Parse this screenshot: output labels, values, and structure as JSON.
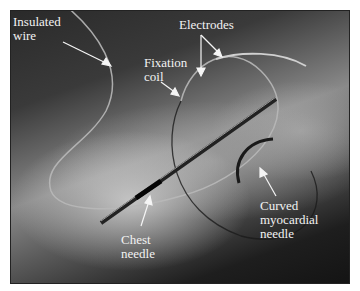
{
  "figure": {
    "labels": {
      "insulated_wire": "Insulated\nwire",
      "electrodes": "Electrodes",
      "fixation_coil": "Fixation\ncoil",
      "chest_needle": "Chest\nneedle",
      "curved_needle": "Curved\nmyocardial\nneedle"
    },
    "colors": {
      "label_text": "#f2f2f2",
      "arrow": "#f5f5f5",
      "frame_border": "#222222",
      "page_background": "#ffffff"
    }
  }
}
